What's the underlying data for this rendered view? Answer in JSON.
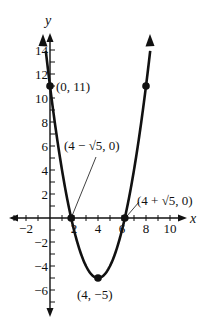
{
  "chart_data": {
    "type": "line",
    "title": "",
    "function": "y = x^2 - 8x + 11",
    "xlabel": "x",
    "ylabel": "y",
    "xlim": [
      -3.3,
      11.2
    ],
    "ylim": [
      -8.2,
      15
    ],
    "grid": false,
    "legend": null,
    "x_ticks": [
      -2,
      2,
      4,
      6,
      8,
      10
    ],
    "x_tick_labels": [
      "−2",
      "2",
      "4",
      "6",
      "8",
      "10"
    ],
    "y_ticks": [
      -6,
      -4,
      -2,
      2,
      4,
      6,
      8,
      10,
      12,
      14
    ],
    "y_tick_labels": [
      "−6",
      "−4",
      "−2",
      "2",
      "4",
      "6",
      "8",
      "10",
      "12",
      "14"
    ],
    "minor_tick_step": 1,
    "series": [
      {
        "name": "parabola",
        "x_range": [
          -0.35,
          8.35
        ],
        "color": "#111111"
      }
    ],
    "points": [
      {
        "x": 0,
        "y": 11,
        "label": "(0, 11)"
      },
      {
        "x": 1.764,
        "y": 0,
        "label": "(4 − √5, 0)"
      },
      {
        "x": 6.236,
        "y": 0,
        "label": "(4 + √5, 0)"
      },
      {
        "x": 4,
        "y": -5,
        "label": "(4, −5)"
      },
      {
        "x": 8,
        "y": 11,
        "label": ""
      }
    ]
  },
  "layout": {
    "origin_px": [
      50,
      218
    ],
    "unit_px": 12,
    "colors": {
      "ink": "#111111",
      "background": "#ffffff"
    }
  }
}
